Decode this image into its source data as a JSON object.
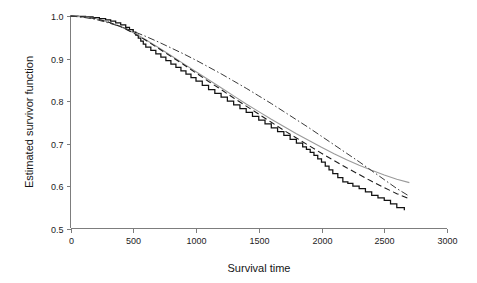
{
  "chart_data": {
    "type": "line",
    "title": "",
    "xlabel": "Survival time",
    "ylabel": "Estimated survivor function",
    "xlim": [
      0,
      3000
    ],
    "ylim": [
      0.5,
      1.0
    ],
    "grid": false,
    "legend": "none",
    "xticks": [
      0,
      500,
      1000,
      1500,
      2000,
      2500,
      3000
    ],
    "xtick_labels": [
      "0",
      "500",
      "1000",
      "1500",
      "2000",
      "2500",
      "3000"
    ],
    "yticks": [
      0.5,
      0.6,
      0.7,
      0.8,
      0.9,
      1.0
    ],
    "ytick_labels": [
      "0.5",
      "0.6",
      "0.7",
      "0.8",
      "0.9",
      "1.0"
    ],
    "series": [
      {
        "name": "Kaplan-Meier estimate",
        "style": "step",
        "color": "#111111",
        "x": [
          0,
          60,
          120,
          180,
          230,
          280,
          320,
          360,
          400,
          440,
          470,
          500,
          520,
          540,
          560,
          580,
          600,
          640,
          680,
          720,
          760,
          800,
          840,
          880,
          920,
          960,
          1000,
          1050,
          1100,
          1150,
          1200,
          1250,
          1300,
          1350,
          1400,
          1450,
          1500,
          1550,
          1600,
          1650,
          1700,
          1750,
          1800,
          1850,
          1880,
          1910,
          1940,
          1970,
          2000,
          2030,
          2060,
          2090,
          2130,
          2170,
          2210,
          2250,
          2300,
          2350,
          2400,
          2450,
          2500,
          2550,
          2600,
          2660
        ],
        "y": [
          1.0,
          0.999,
          0.998,
          0.996,
          0.994,
          0.991,
          0.988,
          0.984,
          0.979,
          0.973,
          0.968,
          0.962,
          0.955,
          0.948,
          0.941,
          0.934,
          0.927,
          0.919,
          0.911,
          0.903,
          0.895,
          0.887,
          0.879,
          0.871,
          0.863,
          0.855,
          0.847,
          0.837,
          0.827,
          0.818,
          0.809,
          0.8,
          0.791,
          0.782,
          0.773,
          0.764,
          0.755,
          0.746,
          0.737,
          0.728,
          0.719,
          0.71,
          0.701,
          0.692,
          0.686,
          0.679,
          0.672,
          0.664,
          0.656,
          0.647,
          0.638,
          0.629,
          0.62,
          0.61,
          0.606,
          0.6,
          0.594,
          0.586,
          0.578,
          0.572,
          0.566,
          0.558,
          0.549,
          0.543
        ]
      },
      {
        "name": "Smooth fitted survivor curve",
        "style": "solid-gray",
        "color": "#9a9a9a",
        "x": [
          0,
          100,
          200,
          300,
          400,
          500,
          600,
          700,
          800,
          900,
          1000,
          1100,
          1200,
          1300,
          1400,
          1500,
          1600,
          1700,
          1800,
          1900,
          2000,
          2100,
          2200,
          2300,
          2400,
          2500,
          2600,
          2700
        ],
        "y": [
          1.0,
          0.998,
          0.994,
          0.986,
          0.975,
          0.961,
          0.944,
          0.926,
          0.907,
          0.888,
          0.869,
          0.85,
          0.831,
          0.812,
          0.793,
          0.775,
          0.757,
          0.74,
          0.723,
          0.707,
          0.691,
          0.676,
          0.662,
          0.649,
          0.637,
          0.626,
          0.616,
          0.608
        ]
      },
      {
        "name": "Parametric model fit",
        "style": "dashed",
        "color": "#1a1a1a",
        "x": [
          0,
          100,
          200,
          300,
          400,
          500,
          600,
          700,
          800,
          900,
          1000,
          1100,
          1200,
          1300,
          1400,
          1500,
          1600,
          1700,
          1800,
          1900,
          2000,
          2100,
          2200,
          2300,
          2400,
          2500,
          2600,
          2700
        ],
        "y": [
          1.0,
          0.998,
          0.994,
          0.986,
          0.975,
          0.96,
          0.943,
          0.924,
          0.905,
          0.886,
          0.866,
          0.846,
          0.827,
          0.807,
          0.788,
          0.769,
          0.75,
          0.731,
          0.713,
          0.695,
          0.677,
          0.66,
          0.643,
          0.627,
          0.611,
          0.596,
          0.582,
          0.57
        ]
      },
      {
        "name": "Alternative model fit",
        "style": "dash-dot",
        "color": "#3a3a3a",
        "x": [
          0,
          100,
          200,
          300,
          400,
          500,
          600,
          700,
          800,
          900,
          1000,
          1100,
          1200,
          1300,
          1400,
          1500,
          1600,
          1700,
          1800,
          1900,
          2000,
          2100,
          2200,
          2300,
          2400,
          2500,
          2600,
          2700
        ],
        "y": [
          1.0,
          0.997,
          0.992,
          0.984,
          0.975,
          0.964,
          0.952,
          0.939,
          0.925,
          0.911,
          0.896,
          0.88,
          0.864,
          0.847,
          0.83,
          0.812,
          0.794,
          0.775,
          0.756,
          0.737,
          0.717,
          0.697,
          0.677,
          0.657,
          0.636,
          0.615,
          0.594,
          0.576
        ]
      }
    ]
  }
}
